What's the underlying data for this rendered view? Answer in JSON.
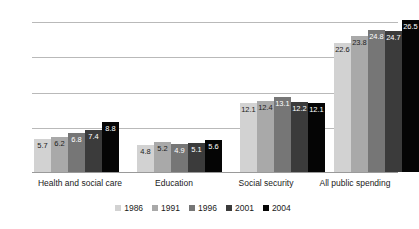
{
  "chart_data": {
    "type": "bar",
    "title": "",
    "xlabel": "",
    "ylabel": "SHARE OF GDP",
    "ylim": [
      0,
      29
    ],
    "grid": true,
    "gridlines": [
      5,
      11,
      17,
      23,
      29
    ],
    "legend_position": "bottom",
    "categories": [
      "Health and social care",
      "Education",
      "Social security",
      "All public spending"
    ],
    "series": [
      {
        "name": "1986",
        "color": "#d2d2d2",
        "label_color": "dark",
        "values": [
          5.7,
          4.8,
          12.1,
          22.6
        ]
      },
      {
        "name": "1991",
        "color": "#a9a9a9",
        "label_color": "dark",
        "values": [
          6.2,
          5.2,
          12.4,
          23.8
        ]
      },
      {
        "name": "1996",
        "color": "#767676",
        "label_color": "light",
        "values": [
          6.8,
          4.9,
          13.1,
          24.8
        ]
      },
      {
        "name": "2001",
        "color": "#3b3b3b",
        "label_color": "light",
        "values": [
          7.4,
          5.1,
          12.2,
          24.7
        ]
      },
      {
        "name": "2004",
        "color": "#050505",
        "label_color": "light",
        "values": [
          8.8,
          5.6,
          12.1,
          26.5
        ]
      }
    ]
  },
  "colors": {
    "gridline": "#b9b9b9",
    "baseline": "#9a9a9a",
    "background": "#ffffff",
    "text": "#1a1a1a"
  }
}
